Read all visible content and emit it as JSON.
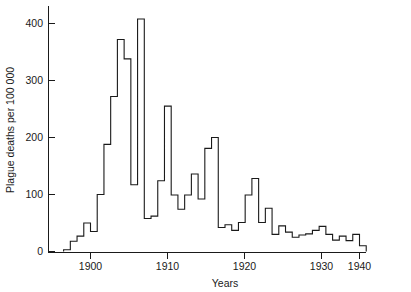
{
  "chart_data": {
    "type": "line",
    "title": "",
    "subtitle": "",
    "xlabel": "Years",
    "ylabel": "Plague deaths per 100 000",
    "xlim": [
      1895,
      1941
    ],
    "ylim": [
      0,
      440
    ],
    "grid": false,
    "legend": null,
    "annotations": [],
    "drawing_style": "step-post (annual step plot, no fill)",
    "line_color": "#1a1a1a",
    "background_color": "#ffffff",
    "xticks": [
      1900,
      1910,
      1920,
      1930,
      1940
    ],
    "xtick_labels": [
      "1900",
      "1910",
      "1920",
      "1930",
      "1940"
    ],
    "yticks": [
      0,
      100,
      200,
      300,
      400
    ],
    "ytick_labels": [
      "0",
      "100",
      "200",
      "300",
      "400"
    ],
    "x": [
      1896,
      1897,
      1898,
      1899,
      1900,
      1901,
      1902,
      1903,
      1904,
      1905,
      1906,
      1907,
      1908,
      1909,
      1910,
      1911,
      1912,
      1913,
      1914,
      1915,
      1916,
      1917,
      1918,
      1919,
      1920,
      1921,
      1922,
      1923,
      1924,
      1925,
      1926,
      1927,
      1928,
      1929,
      1930,
      1931,
      1932,
      1933,
      1934,
      1935,
      1936,
      1937,
      1938,
      1939,
      1940
    ],
    "values": [
      3,
      18,
      27,
      50,
      35,
      100,
      188,
      272,
      372,
      338,
      117,
      408,
      58,
      62,
      124,
      255,
      99,
      74,
      99,
      136,
      92,
      181,
      200,
      42,
      47,
      37,
      51,
      99,
      128,
      51,
      76,
      30,
      45,
      34,
      25,
      29,
      31,
      37,
      44,
      30,
      20,
      27,
      19,
      30,
      10
    ],
    "series": [
      {
        "name": "Plague deaths per 100 000",
        "values": [
          3,
          18,
          27,
          50,
          35,
          100,
          188,
          272,
          372,
          338,
          117,
          408,
          58,
          62,
          124,
          255,
          99,
          74,
          99,
          136,
          92,
          181,
          200,
          42,
          47,
          37,
          51,
          99,
          128,
          51,
          76,
          30,
          45,
          34,
          25,
          29,
          31,
          37,
          44,
          30,
          20,
          27,
          19,
          30,
          10
        ]
      }
    ],
    "peak_year": 1907,
    "peak_value": 408
  },
  "axes": {
    "x_axis_title": "Years",
    "y_axis_title": "Plague deaths per 100 000"
  }
}
